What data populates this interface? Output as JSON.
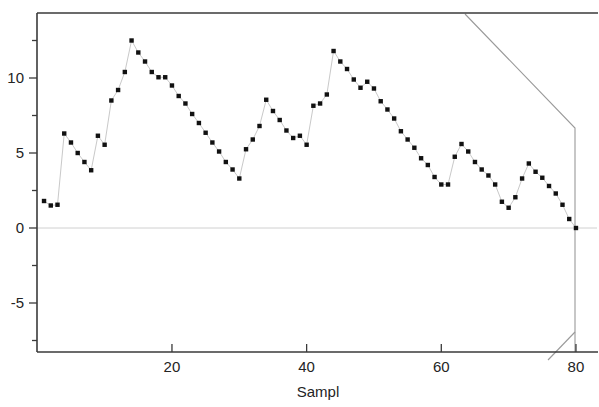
{
  "chart_data": {
    "type": "scatter",
    "title": "",
    "subtitle": "",
    "xlabel": "Sampl",
    "ylabel": "",
    "xlim": [
      0,
      86
    ],
    "ylim": [
      -8.2,
      13.8
    ],
    "xticks": [
      20,
      40,
      60,
      80
    ],
    "xtick_labels": [
      "20",
      "40",
      "60",
      "80"
    ],
    "yticks": [
      -5,
      0,
      5,
      10
    ],
    "ytick_labels": [
      "-5",
      "0",
      "5",
      "10"
    ],
    "y_minor_ticks": [
      -7.5,
      -2.5,
      2.5,
      7.5,
      12.5
    ],
    "grid": false,
    "zero_line": true,
    "zero_line_value": 0,
    "legend": null,
    "marker": "square",
    "marker_color": "#111111",
    "line_color": "#c9c9c9",
    "x": [
      1,
      2,
      3,
      4,
      5,
      6,
      7,
      8,
      9,
      10,
      11,
      12,
      13,
      14,
      15,
      16,
      17,
      18,
      19,
      20,
      21,
      22,
      23,
      24,
      25,
      26,
      27,
      28,
      29,
      30,
      31,
      32,
      33,
      34,
      35,
      36,
      37,
      38,
      39,
      40,
      41,
      42,
      43,
      44,
      45,
      46,
      47,
      48,
      49,
      50,
      51,
      52,
      53,
      54,
      55,
      56,
      57,
      58,
      59,
      60,
      61,
      62,
      63,
      64,
      65,
      66,
      67,
      68,
      69,
      70,
      71,
      72,
      73,
      74,
      75,
      76,
      77,
      78,
      79,
      80
    ],
    "y": [
      1.8,
      1.5,
      1.55,
      6.3,
      5.7,
      5.0,
      4.4,
      3.85,
      6.15,
      5.55,
      8.5,
      9.2,
      10.4,
      12.5,
      11.7,
      11.1,
      10.4,
      10.05,
      10.05,
      9.5,
      8.8,
      8.3,
      7.6,
      7.0,
      6.35,
      5.7,
      5.1,
      4.4,
      3.9,
      3.3,
      5.25,
      5.9,
      6.8,
      8.55,
      7.8,
      7.2,
      6.5,
      6.0,
      6.15,
      5.55,
      8.15,
      8.3,
      8.9,
      11.8,
      11.1,
      10.6,
      9.9,
      9.35,
      9.75,
      9.3,
      8.45,
      7.9,
      7.3,
      6.45,
      5.9,
      5.35,
      4.65,
      4.2,
      3.4,
      2.9,
      2.9,
      4.75,
      5.6,
      5.1,
      4.4,
      3.9,
      3.5,
      2.9,
      1.75,
      1.35,
      2.05,
      3.3,
      4.3,
      3.75,
      3.35,
      2.8,
      2.3,
      1.55,
      0.6,
      0.0
    ],
    "annotations": []
  },
  "axes": {
    "x_axis_title": "Sampl",
    "y_axis_title": ""
  },
  "artifacts": {
    "description": "scan-edge-lines",
    "present": true
  }
}
